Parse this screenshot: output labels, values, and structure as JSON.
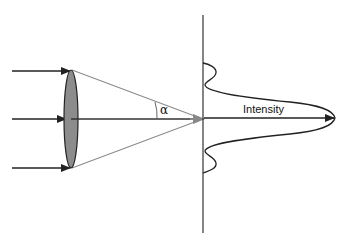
{
  "diagram": {
    "labels": {
      "angle": "α",
      "intensity": "Intensity"
    },
    "colors": {
      "lens_fill": "#8c8c8c",
      "cone_lines": "#8a8a8a",
      "lines": "#222222",
      "background": "#ffffff"
    },
    "elements": {
      "incoming_rays": 3,
      "lens": "converging lens (ellipse)",
      "focal_point": "arrow tip at screen",
      "screen": "vertical line",
      "intensity_profile": "Airy pattern: central peak with side lobes"
    }
  }
}
